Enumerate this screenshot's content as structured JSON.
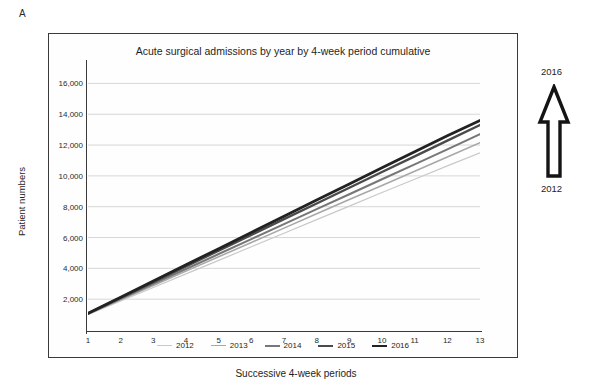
{
  "panel": {
    "label": "A"
  },
  "axis_titles": {
    "y": "Patient numbers",
    "x": "Successive 4-week periods"
  },
  "annotation": {
    "top_year": "2016",
    "bottom_year": "2012",
    "arrow": "up-arrow-outline"
  },
  "chart_data": {
    "type": "line",
    "title": "Acute surgical admissions by year by 4-week period cumulative",
    "xlabel": "Successive 4-week periods",
    "ylabel": "Patient numbers",
    "x": [
      1,
      2,
      3,
      4,
      5,
      6,
      7,
      8,
      9,
      10,
      11,
      12,
      13
    ],
    "xtick_labels": [
      "1",
      "2",
      "3",
      "4",
      "5",
      "6",
      "7",
      "8",
      "9",
      "10",
      "11",
      "12",
      "13"
    ],
    "ytick_labels": [
      "2,000",
      "4,000",
      "6,000",
      "8,000",
      "10,000",
      "12,000",
      "14,000",
      "16,000"
    ],
    "ytick_values": [
      2000,
      4000,
      6000,
      8000,
      10000,
      12000,
      14000,
      16000
    ],
    "ylim": [
      0,
      17000
    ],
    "xlim": [
      1,
      13
    ],
    "grid": "horizontal",
    "legend_position": "bottom",
    "series": [
      {
        "name": "2012",
        "color": "#c9c9c9",
        "width": 1.2,
        "values": [
          1000,
          1880,
          2760,
          3640,
          4520,
          5400,
          6280,
          7160,
          8040,
          8920,
          9780,
          10650,
          11500
        ]
      },
      {
        "name": "2013",
        "color": "#a8a8a8",
        "width": 1.6,
        "values": [
          1030,
          1960,
          2890,
          3820,
          4750,
          5680,
          6610,
          7540,
          8470,
          9380,
          10300,
          11230,
          12150
        ]
      },
      {
        "name": "2014",
        "color": "#777777",
        "width": 2.0,
        "values": [
          1050,
          2020,
          2990,
          3960,
          4930,
          5900,
          6870,
          7840,
          8810,
          9780,
          10750,
          11720,
          12700
        ]
      },
      {
        "name": "2015",
        "color": "#4a4a4a",
        "width": 2.4,
        "values": [
          1070,
          2090,
          3110,
          4130,
          5150,
          6170,
          7190,
          8210,
          9230,
          10250,
          11270,
          12290,
          13300
        ]
      },
      {
        "name": "2016",
        "color": "#222222",
        "width": 2.8,
        "values": [
          1080,
          2130,
          3180,
          4230,
          5280,
          6330,
          7380,
          8430,
          9480,
          10530,
          11570,
          12600,
          13600
        ]
      }
    ]
  }
}
